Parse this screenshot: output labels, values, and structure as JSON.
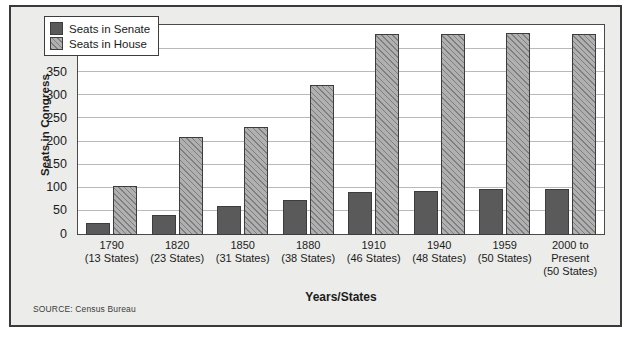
{
  "chart_data": {
    "type": "bar",
    "title": "",
    "xlabel": "Years/States",
    "ylabel": "Seats in Congress",
    "ylim": [
      0,
      450
    ],
    "ytick_step": 50,
    "yticks": [
      450,
      400,
      350,
      300,
      250,
      200,
      150,
      100,
      50,
      0
    ],
    "grid": true,
    "legend_position": "top-left inside plot",
    "categories": [
      "1790\n(13 States)",
      "1820\n(23 States)",
      "1850\n(31 States)",
      "1880\n(38 States)",
      "1910\n(46 States)",
      "1940\n(48 States)",
      "1959\n(50 States)",
      "2000 to\nPresent\n(50 States)"
    ],
    "category_lines": [
      [
        "1790",
        "(13 States)"
      ],
      [
        "1820",
        "(23 States)"
      ],
      [
        "1850",
        "(31 States)"
      ],
      [
        "1880",
        "(38 States)"
      ],
      [
        "1910",
        "(46 States)"
      ],
      [
        "1940",
        "(48 States)"
      ],
      [
        "1959",
        "(50 States)"
      ],
      [
        "2000 to",
        "Present",
        "(50 States)"
      ]
    ],
    "series": [
      {
        "name": "Seats in Senate",
        "color": "#5a5a5a",
        "values": [
          26,
          44,
          62,
          76,
          92,
          96,
          100,
          100
        ]
      },
      {
        "name": "Seats in House",
        "color": "#b0b0b0",
        "values": [
          105,
          213,
          234,
          325,
          435,
          435,
          437,
          435
        ]
      }
    ],
    "annotations": [
      "SOURCE: Census Bureau"
    ]
  },
  "legend": {
    "items": [
      {
        "label": "Seats in Senate"
      },
      {
        "label": "Seats in House"
      }
    ]
  },
  "footer": {
    "source": "SOURCE: Census Bureau"
  },
  "colors": {
    "senate": "#5a5a5a",
    "house": "#b0b0b0",
    "card_background": "#ececea",
    "plot_background": "#ffffff",
    "frame": "#3a3a3a",
    "gridline": "#b9b9b9",
    "text": "#1b1b1b"
  }
}
